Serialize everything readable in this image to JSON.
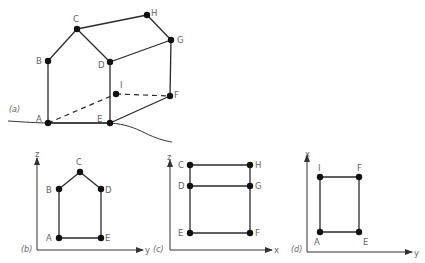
{
  "figure": {
    "panels": [
      {
        "id": "a",
        "label": "(a)",
        "view": "perspective",
        "points": {
          "A": "A",
          "B": "B",
          "C": "C",
          "D": "D",
          "E": "E",
          "F": "F",
          "G": "G",
          "H": "H",
          "I": "I"
        }
      },
      {
        "id": "b",
        "label": "(b)",
        "view": "front",
        "axes": {
          "vertical": "z",
          "horizontal": "y"
        },
        "points": [
          "A",
          "B",
          "C",
          "D",
          "E"
        ]
      },
      {
        "id": "c",
        "label": "(c)",
        "view": "side",
        "axes": {
          "vertical": "z",
          "horizontal": "x"
        },
        "points": [
          "C",
          "H",
          "D",
          "G",
          "E",
          "F"
        ]
      },
      {
        "id": "d",
        "label": "(d)",
        "view": "top",
        "axes": {
          "vertical": "x",
          "horizontal": "y"
        },
        "points": [
          "I",
          "F",
          "A",
          "E"
        ]
      }
    ]
  },
  "labels": {
    "a": {
      "panel": "(a)",
      "A": "A",
      "B": "B",
      "C": "C",
      "D": "D",
      "E": "E",
      "F": "F",
      "G": "G",
      "H": "H",
      "I": "I"
    },
    "b": {
      "panel": "(b)",
      "axis_v": "z",
      "axis_h": "y",
      "A": "A",
      "B": "B",
      "C": "C",
      "D": "D",
      "E": "E"
    },
    "c": {
      "panel": "(c)",
      "axis_v": "z",
      "axis_h": "x",
      "C": "C",
      "H": "H",
      "D": "D",
      "G": "G",
      "E": "E",
      "F": "F"
    },
    "d": {
      "panel": "(d)",
      "axis_v": "x",
      "axis_h": "y",
      "I": "I",
      "F": "F",
      "A": "A",
      "E": "E"
    }
  },
  "colors": {
    "line": "#2a2a2a",
    "point": "#111111",
    "text": "#666666",
    "background": "#ffffff"
  }
}
